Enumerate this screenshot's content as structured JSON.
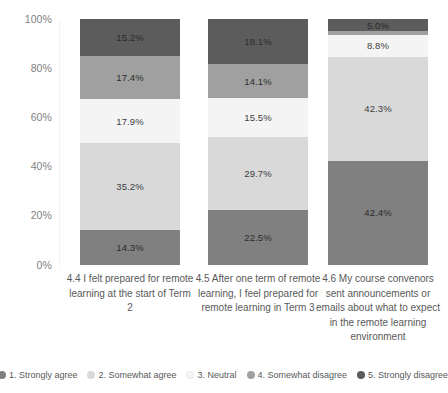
{
  "chart_data": {
    "type": "bar",
    "subtype": "stacked-100-percent",
    "title": "",
    "subtitle": "",
    "xlabel": "",
    "ylabel": "",
    "ylim": [
      0,
      100
    ],
    "grid": false,
    "legend_position": "bottom",
    "y_ticks": [
      "0%",
      "20%",
      "40%",
      "60%",
      "80%",
      "100%"
    ],
    "y_tick_values": [
      0,
      20,
      40,
      60,
      80,
      100
    ],
    "categories": [
      "4.4 I felt prepared for remote learning at the start of Term 2",
      "4.5 After one term of remote learning, I feel prepared for remote learning in Term 3",
      "4.6 My course convenors sent announcements or emails about what to expect in the remote learning environment"
    ],
    "series": [
      {
        "name": "1. Strongly agree",
        "color": "#808080",
        "values": [
          14.3,
          22.5,
          42.4
        ],
        "labels": [
          "14.3%",
          "22.5%",
          "42.4%"
        ]
      },
      {
        "name": "2. Somewhat agree",
        "color": "#d9d9d9",
        "values": [
          35.2,
          29.7,
          42.3
        ],
        "labels": [
          "35.2%",
          "29.7%",
          "42.3%"
        ]
      },
      {
        "name": "3. Neutral",
        "color": "#f4f4f4",
        "values": [
          17.9,
          15.5,
          8.8
        ],
        "labels": [
          "17.9%",
          "15.5%",
          "8.8%"
        ]
      },
      {
        "name": "4. Somewhat disagree",
        "color": "#a0a0a0",
        "values": [
          17.4,
          14.1,
          1.5
        ],
        "labels": [
          "17.4%",
          "14.1%",
          ""
        ]
      },
      {
        "name": "5. Strongly disagree",
        "color": "#5c5c5c",
        "values": [
          15.2,
          18.1,
          5.0
        ],
        "labels": [
          "15.2%",
          "18.1%",
          "5.0%"
        ]
      }
    ]
  },
  "legend": {
    "items": [
      {
        "label": "1. Strongly agree",
        "color": "#808080"
      },
      {
        "label": "2. Somewhat agree",
        "color": "#d9d9d9"
      },
      {
        "label": "3. Neutral",
        "color": "#f4f4f4"
      },
      {
        "label": "4. Somewhat disagree",
        "color": "#a0a0a0"
      },
      {
        "label": "5. Strongly disagree",
        "color": "#5c5c5c"
      }
    ]
  }
}
